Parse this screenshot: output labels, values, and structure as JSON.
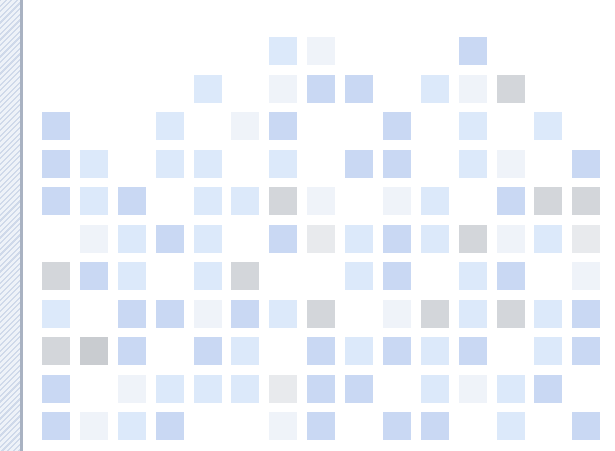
{
  "decoration": {
    "side_strip": {
      "pattern": "diagonal-hatch",
      "color": "#dfe6f1",
      "border_color": "#a9b2c2"
    }
  },
  "mosaic": {
    "tile_size": 28,
    "columns_x": [
      42,
      80,
      118,
      156,
      194,
      231,
      269,
      307,
      345,
      383,
      421,
      459,
      497,
      534,
      572
    ],
    "rows_y": [
      37,
      75,
      112,
      150,
      187,
      225,
      262,
      300,
      337,
      375,
      412
    ],
    "palette": {
      "blue": "#c9d8f3",
      "light": "#dce9fa",
      "faint": "#eff3f9",
      "gray": "#d3d6da",
      "dgray": "#c9ccd0",
      "fgray": "#e8eaed"
    },
    "rows": [
      [
        null,
        null,
        null,
        null,
        null,
        null,
        "light",
        "faint",
        null,
        null,
        null,
        "blue",
        null,
        null,
        null
      ],
      [
        null,
        null,
        null,
        null,
        "light",
        null,
        "faint",
        "blue",
        "blue",
        null,
        "light",
        "faint",
        "gray",
        null,
        null
      ],
      [
        "blue",
        null,
        null,
        "light",
        null,
        "faint",
        "blue",
        null,
        null,
        "blue",
        null,
        "light",
        null,
        "light",
        null
      ],
      [
        "blue",
        "light",
        null,
        "light",
        "light",
        null,
        "light",
        null,
        "blue",
        "blue",
        null,
        "light",
        "faint",
        null,
        "blue"
      ],
      [
        "blue",
        "light",
        "blue",
        null,
        "light",
        "light",
        "gray",
        "faint",
        null,
        "faint",
        "light",
        null,
        "blue",
        "gray",
        "gray"
      ],
      [
        null,
        "faint",
        "light",
        "blue",
        "light",
        null,
        "blue",
        "fgray",
        "light",
        "blue",
        "light",
        "gray",
        "faint",
        "light",
        "fgray"
      ],
      [
        "gray",
        "blue",
        "light",
        null,
        "light",
        "gray",
        null,
        null,
        "light",
        "blue",
        null,
        "light",
        "blue",
        null,
        "faint"
      ],
      [
        "light",
        null,
        "blue",
        "blue",
        "faint",
        "blue",
        "light",
        "gray",
        null,
        "faint",
        "gray",
        "light",
        "gray",
        "light",
        "blue"
      ],
      [
        "gray",
        "dgray",
        "blue",
        null,
        "blue",
        "light",
        null,
        "blue",
        "light",
        "blue",
        "light",
        "blue",
        null,
        "light",
        "blue"
      ],
      [
        "blue",
        null,
        "faint",
        "light",
        "light",
        "light",
        "fgray",
        "blue",
        "blue",
        null,
        "light",
        "faint",
        "light",
        "blue",
        null
      ],
      [
        "blue",
        "faint",
        "light",
        "blue",
        null,
        null,
        "faint",
        "blue",
        null,
        "blue",
        "blue",
        null,
        "light",
        null,
        "blue"
      ]
    ]
  }
}
